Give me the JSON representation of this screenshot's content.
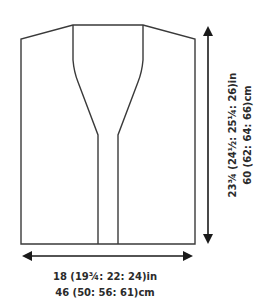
{
  "diagram": {
    "type": "knitting-schematic",
    "width_measurement": {
      "imperial": "18 (19¾: 22: 24)in",
      "metric": "46 (50: 56: 61)cm"
    },
    "length_measurement": {
      "imperial": "23¾ (24½: 25¼: 26)in",
      "metric": "60 (62: 64: 66)cm"
    },
    "colors": {
      "outline": "#3a3a3a",
      "arrow": "#1a1a1a",
      "text": "#2b2b2b",
      "background": "#ffffff"
    }
  }
}
